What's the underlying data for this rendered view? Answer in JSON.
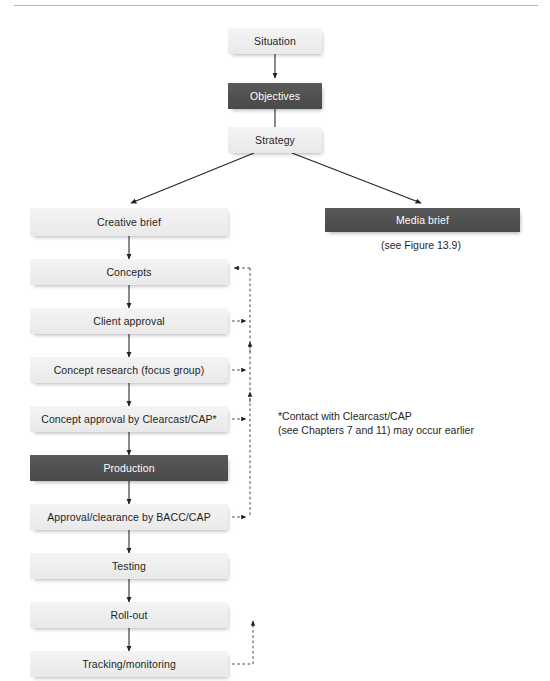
{
  "figure": {
    "title_rule": true,
    "accent_dark": "#4f4f4f",
    "accent_light": "#eeeeee",
    "line_color": "#222222"
  },
  "nodes": {
    "situation": {
      "label": "Situation",
      "style": "light"
    },
    "objectives": {
      "label": "Objectives",
      "style": "dark"
    },
    "strategy": {
      "label": "Strategy",
      "style": "light"
    },
    "creative_brief": {
      "label": "Creative brief",
      "style": "light"
    },
    "media_brief": {
      "label": "Media brief",
      "style": "dark"
    },
    "concepts": {
      "label": "Concepts",
      "style": "light"
    },
    "client_approval": {
      "label": "Client approval",
      "style": "light"
    },
    "concept_research": {
      "label": "Concept research (focus group)",
      "style": "light"
    },
    "concept_approval": {
      "label": "Concept approval by Clearcast/CAP*",
      "style": "light"
    },
    "production": {
      "label": "Production",
      "style": "dark"
    },
    "approval_clearance": {
      "label": "Approval/clearance by BACC/CAP",
      "style": "light"
    },
    "testing": {
      "label": "Testing",
      "style": "light"
    },
    "rollout": {
      "label": "Roll-out",
      "style": "light"
    },
    "tracking": {
      "label": "Tracking/monitoring",
      "style": "light"
    }
  },
  "captions": {
    "media_brief_ref": "(see Figure 13.9)"
  },
  "notes": {
    "clearcast_footnote": "*Contact with Clearcast/CAP\n(see Chapters 7 and 11) may occur earlier"
  }
}
